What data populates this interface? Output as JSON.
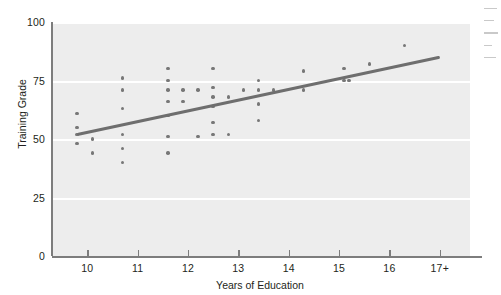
{
  "chart_data": {
    "type": "scatter",
    "title": "",
    "xlabel": "Years of Education",
    "ylabel": "Training Grade",
    "xlim": [
      9.3,
      17.6
    ],
    "ylim": [
      0,
      100
    ],
    "grid": true,
    "legend": null,
    "x_tick_labels": [
      "10",
      "11",
      "12",
      "13",
      "14",
      "15",
      "16",
      "17+"
    ],
    "x_tick_values": [
      10,
      11,
      12,
      13,
      14,
      15,
      16,
      17
    ],
    "y_tick_labels": [
      "0",
      "25",
      "50",
      "75",
      "100"
    ],
    "y_tick_values": [
      0,
      25,
      50,
      75,
      100
    ],
    "points": [
      [
        9.8,
        61
      ],
      [
        9.8,
        55
      ],
      [
        9.8,
        52
      ],
      [
        9.8,
        48
      ],
      [
        10.1,
        50
      ],
      [
        10.1,
        44
      ],
      [
        10.7,
        76
      ],
      [
        10.7,
        71
      ],
      [
        10.7,
        63
      ],
      [
        10.7,
        52
      ],
      [
        10.7,
        46
      ],
      [
        10.7,
        40
      ],
      [
        11.6,
        80
      ],
      [
        11.6,
        75
      ],
      [
        11.6,
        71
      ],
      [
        11.6,
        66
      ],
      [
        11.6,
        60
      ],
      [
        11.6,
        51
      ],
      [
        11.6,
        44
      ],
      [
        11.9,
        71
      ],
      [
        11.9,
        66
      ],
      [
        12.2,
        71
      ],
      [
        12.2,
        51
      ],
      [
        12.5,
        80
      ],
      [
        12.5,
        72
      ],
      [
        12.5,
        68
      ],
      [
        12.5,
        64
      ],
      [
        12.5,
        57
      ],
      [
        12.5,
        52
      ],
      [
        12.8,
        68
      ],
      [
        12.8,
        52
      ],
      [
        13.1,
        71
      ],
      [
        13.4,
        75
      ],
      [
        13.4,
        71
      ],
      [
        13.4,
        65
      ],
      [
        13.4,
        58
      ],
      [
        13.7,
        71
      ],
      [
        14.3,
        79
      ],
      [
        14.3,
        71
      ],
      [
        15.1,
        80
      ],
      [
        15.1,
        75
      ],
      [
        15.2,
        75
      ],
      [
        15.6,
        82
      ],
      [
        16.3,
        90
      ]
    ],
    "trendline": {
      "label": "linear fit",
      "x_start": 9.8,
      "y_start": 52,
      "x_end": 17.0,
      "y_end": 85
    }
  },
  "edge_artifact": {
    "description": "illegible-margin-text"
  }
}
